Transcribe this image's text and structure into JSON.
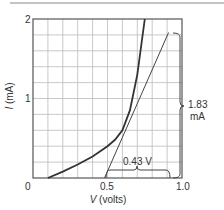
{
  "chart_data": {
    "type": "line",
    "title": "",
    "xlabel": "V (volts)",
    "xlabel_var": "V",
    "xlabel_unit": "(volts)",
    "ylabel": "I (mA)",
    "ylabel_var": "I",
    "ylabel_unit": "(mA)",
    "xlim": [
      0,
      1.0
    ],
    "ylim": [
      0,
      2
    ],
    "grid": true,
    "x_ticks": [
      "0",
      "0.5",
      "1.0"
    ],
    "y_ticks": [
      "1",
      "2"
    ],
    "series": [
      {
        "name": "diode I-V curve",
        "x": [
          0.1,
          0.2,
          0.3,
          0.4,
          0.5,
          0.55,
          0.6,
          0.65,
          0.7,
          0.75
        ],
        "y": [
          0.0,
          0.08,
          0.17,
          0.27,
          0.4,
          0.48,
          0.6,
          0.85,
          1.3,
          2.0
        ]
      },
      {
        "name": "tangent line",
        "x": [
          0.48,
          0.91
        ],
        "y": [
          0.0,
          1.83
        ]
      }
    ],
    "annotations": [
      {
        "text": "0.43 V",
        "type": "horizontal-brace",
        "from_x": 0.48,
        "to_x": 0.91,
        "y": 0.0
      },
      {
        "text": "1.83 mA",
        "type": "vertical-brace",
        "from_y": 0.0,
        "to_y": 1.83,
        "x": 0.95
      }
    ]
  },
  "labels": {
    "x0": "0",
    "x05": "0.5",
    "x10": "1.0",
    "y1": "1",
    "y2": "2",
    "ann_v": "0.43 V",
    "ann_i_1": "1.83",
    "ann_i_2": "mA"
  }
}
